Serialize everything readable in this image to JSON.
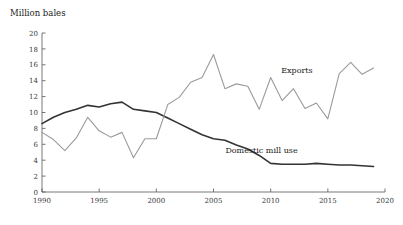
{
  "chart_data": {
    "type": "line",
    "title": "Million bales",
    "xlabel": "",
    "ylabel": "Million bales",
    "xlim": [
      1990,
      2020
    ],
    "ylim": [
      0,
      20
    ],
    "xticks": [
      1990,
      1995,
      2000,
      2005,
      2010,
      2015,
      2020
    ],
    "yticks": [
      0,
      2,
      4,
      6,
      8,
      10,
      12,
      14,
      16,
      18,
      20
    ],
    "grid": false,
    "legend_position": "inline-annotations",
    "x": [
      1990,
      1991,
      1992,
      1993,
      1994,
      1995,
      1996,
      1997,
      1998,
      1999,
      2000,
      2001,
      2002,
      2003,
      2004,
      2005,
      2006,
      2007,
      2008,
      2009,
      2010,
      2011,
      2012,
      2013,
      2014,
      2015,
      2016,
      2017,
      2018,
      2019
    ],
    "series": [
      {
        "name": "Domestic mill use",
        "color": "#333333",
        "width": 1.6,
        "label": "Domestic mill use",
        "label_x": 2009.2,
        "label_y": 4.9,
        "values": [
          8.6,
          9.4,
          10.0,
          10.4,
          10.9,
          10.7,
          11.1,
          11.3,
          10.4,
          10.2,
          10.0,
          9.3,
          8.6,
          7.9,
          7.2,
          6.7,
          6.5,
          5.9,
          5.4,
          4.6,
          3.6,
          3.5,
          3.5,
          3.5,
          3.6,
          3.5,
          3.4,
          3.4,
          3.3,
          3.2
        ]
      },
      {
        "name": "Exports",
        "color": "#9a9a9a",
        "width": 1.1,
        "label": "Exports",
        "label_x": 2012.3,
        "label_y": 15.0,
        "values": [
          7.5,
          6.6,
          5.2,
          6.8,
          9.4,
          7.7,
          6.9,
          7.5,
          4.3,
          6.7,
          6.7,
          11.0,
          11.9,
          13.8,
          14.4,
          17.3,
          13.0,
          13.6,
          13.3,
          10.4,
          14.4,
          11.5,
          13.0,
          10.5,
          11.2,
          9.2,
          14.9,
          16.3,
          14.8,
          15.6
        ]
      }
    ]
  },
  "axis": {
    "y_tick_labels": [
      "0",
      "2",
      "4",
      "6",
      "8",
      "10",
      "12",
      "14",
      "16",
      "18",
      "20"
    ],
    "x_tick_labels": [
      "1990",
      "1995",
      "2000",
      "2005",
      "2010",
      "2015",
      "2020"
    ]
  }
}
